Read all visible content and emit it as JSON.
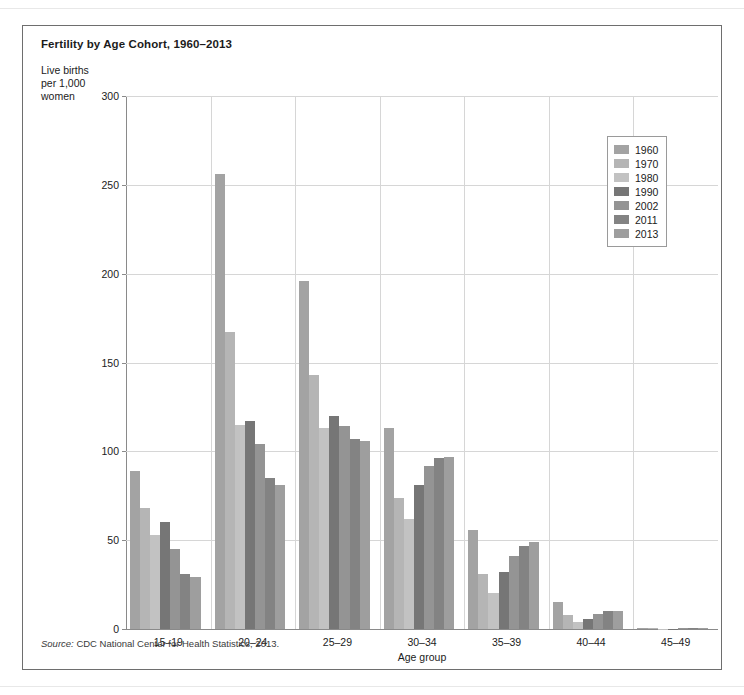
{
  "figure": {
    "title": "Fertility by Age Cohort, 1960–2013",
    "y_axis_title": "Live births per 1,000 women",
    "x_axis_title": "Age group",
    "source_prefix": "Source:",
    "source_text": "CDC National Center for Health Statistics, 2013."
  },
  "chart_data": {
    "type": "bar",
    "title": "Fertility by Age Cohort, 1960–2013",
    "xlabel": "Age group",
    "ylabel": "Live births per 1,000 women",
    "ylim": [
      0,
      300
    ],
    "yticks": [
      0,
      50,
      100,
      150,
      200,
      250,
      300
    ],
    "grid": true,
    "legend_position": "top-right",
    "categories": [
      "15–19",
      "20–24",
      "25–29",
      "30–34",
      "35–39",
      "40–44",
      "45–49"
    ],
    "series": [
      {
        "name": "1960",
        "color": "#a3a3a3",
        "values": [
          89,
          256,
          196,
          113,
          56,
          15,
          0.6
        ]
      },
      {
        "name": "1970",
        "color": "#b5b5b5",
        "values": [
          68,
          167,
          143,
          74,
          31,
          8,
          0.4
        ]
      },
      {
        "name": "1980",
        "color": "#c2c2c2",
        "values": [
          53,
          115,
          113,
          62,
          20,
          4,
          0.2
        ]
      },
      {
        "name": "1990",
        "color": "#767676",
        "values": [
          60,
          117,
          120,
          81,
          32,
          5.5,
          0.2
        ]
      },
      {
        "name": "2002",
        "color": "#949494",
        "values": [
          45,
          104,
          114,
          92,
          41,
          8.3,
          0.5
        ]
      },
      {
        "name": "2011",
        "color": "#838383",
        "values": [
          31,
          85,
          107,
          96,
          47,
          10,
          0.7
        ]
      },
      {
        "name": "2013",
        "color": "#9e9e9e",
        "values": [
          29,
          81,
          106,
          97,
          49,
          10.4,
          0.8
        ]
      }
    ]
  }
}
